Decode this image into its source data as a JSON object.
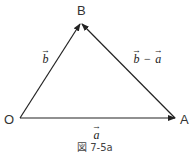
{
  "figure": {
    "caption": "図 7-5a",
    "points": {
      "O": {
        "label": "O"
      },
      "A": {
        "label": "A"
      },
      "B": {
        "label": "B"
      }
    },
    "vectors": {
      "a": {
        "label": "a",
        "arrow": "→"
      },
      "b": {
        "label": "b",
        "arrow": "→"
      },
      "b_minus_a": {
        "b": "b",
        "minus": "−",
        "a": "a",
        "arrow": "→"
      }
    },
    "colors": {
      "line": "#222222",
      "text": "#333333"
    }
  }
}
